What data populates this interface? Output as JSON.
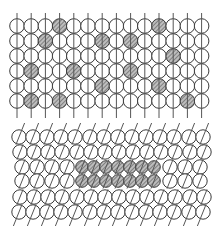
{
  "figure": {
    "width": 221,
    "height": 235,
    "colors": {
      "background": "#ffffff",
      "outline": "#3a3a3a",
      "line": "#555555",
      "hatch_fill": "#bdbdbd",
      "hatch_stroke": "#444444"
    },
    "panels": [
      {
        "name": "top-panel",
        "description": "Regular lattice of circles threaded on vertical lines with scattered hatched circles",
        "rows": 6,
        "cols": 14,
        "origin_x": 17,
        "origin_y": 26,
        "pitch_x": 14.2,
        "pitch_y": 15,
        "radius": 7.3,
        "line_top": 13,
        "line_bottom": 118,
        "shear": 0,
        "hatched_cells": [
          [
            0,
            3
          ],
          [
            0,
            10
          ],
          [
            1,
            2
          ],
          [
            1,
            6
          ],
          [
            1,
            8
          ],
          [
            2,
            11
          ],
          [
            3,
            1
          ],
          [
            3,
            4
          ],
          [
            3,
            8
          ],
          [
            4,
            6
          ],
          [
            4,
            10
          ],
          [
            5,
            1
          ],
          [
            5,
            3
          ],
          [
            5,
            12
          ]
        ]
      },
      {
        "name": "bottom-panel",
        "description": "Sheared lattice with a compacted 2x7 cluster of hatched circles in the middle rows",
        "rows": [
          {
            "y": 137,
            "xs": [
              19,
              33,
              47,
              61,
              75,
              90,
              104,
              118,
              132,
              146,
              160,
              174,
              189,
              203
            ],
            "hatched": []
          },
          {
            "y": 152,
            "xs": [
              20,
              34,
              48,
              62,
              77,
              91,
              105,
              119,
              133,
              147,
              161,
              175,
              190,
              204
            ],
            "hatched": []
          },
          {
            "y": 167,
            "xs": [
              22,
              37,
              52,
              67,
              82,
              94,
              106,
              118,
              130,
              142,
              154,
              170,
              185,
              200
            ],
            "hatched": [
              4,
              5,
              6,
              7,
              8,
              9,
              10
            ]
          },
          {
            "y": 181,
            "xs": [
              22,
              37,
              52,
              67,
              82,
              94,
              106,
              118,
              130,
              142,
              154,
              170,
              185,
              200
            ],
            "hatched": [
              4,
              5,
              6,
              7,
              8,
              9,
              10
            ]
          },
          {
            "y": 197,
            "xs": [
              20,
              34,
              48,
              62,
              77,
              91,
              105,
              119,
              133,
              147,
              161,
              175,
              190,
              204
            ],
            "hatched": []
          },
          {
            "y": 212,
            "xs": [
              19,
              33,
              47,
              61,
              75,
              90,
              104,
              118,
              132,
              146,
              160,
              174,
              189,
              203
            ],
            "hatched": []
          }
        ],
        "radius": 7.2,
        "hatched_radius": 6.3,
        "line_top": 123,
        "line_bottom": 226,
        "line_tilt": 6
      }
    ]
  }
}
